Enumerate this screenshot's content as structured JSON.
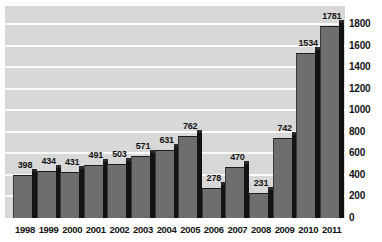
{
  "chart_data": {
    "type": "bar",
    "title": "",
    "subtitle": "",
    "xlabel": "",
    "ylabel": "",
    "categories": [
      "1998",
      "1999",
      "2000",
      "2001",
      "2002",
      "2003",
      "2004",
      "2005",
      "2006",
      "2007",
      "2008",
      "2009",
      "2010",
      "2011"
    ],
    "values": [
      398,
      434,
      431,
      491,
      503,
      571,
      631,
      762,
      278,
      470,
      231,
      742,
      1534,
      1781
    ],
    "data_labels": [
      "398",
      "434",
      "431",
      "491",
      "503",
      "571",
      "631",
      "762",
      "278",
      "470",
      "231",
      "742",
      "1534",
      "1781"
    ],
    "ylim": [
      0,
      1800
    ],
    "yticks": [
      0,
      200,
      400,
      600,
      800,
      1000,
      1200,
      1400,
      1600,
      1800
    ],
    "ytick_labels": [
      "0",
      "200",
      "400",
      "600",
      "800",
      "1000",
      "1200",
      "1400",
      "1600",
      "1800"
    ],
    "y_axis_position": "right",
    "grid": true,
    "grid_color": "#fbfbfb",
    "plot_background": "#d8d8d8",
    "bar_color": "#6e6e6e",
    "bar_shadow_color": "#131313",
    "legend": [],
    "legend_position": "none",
    "annotations": []
  }
}
